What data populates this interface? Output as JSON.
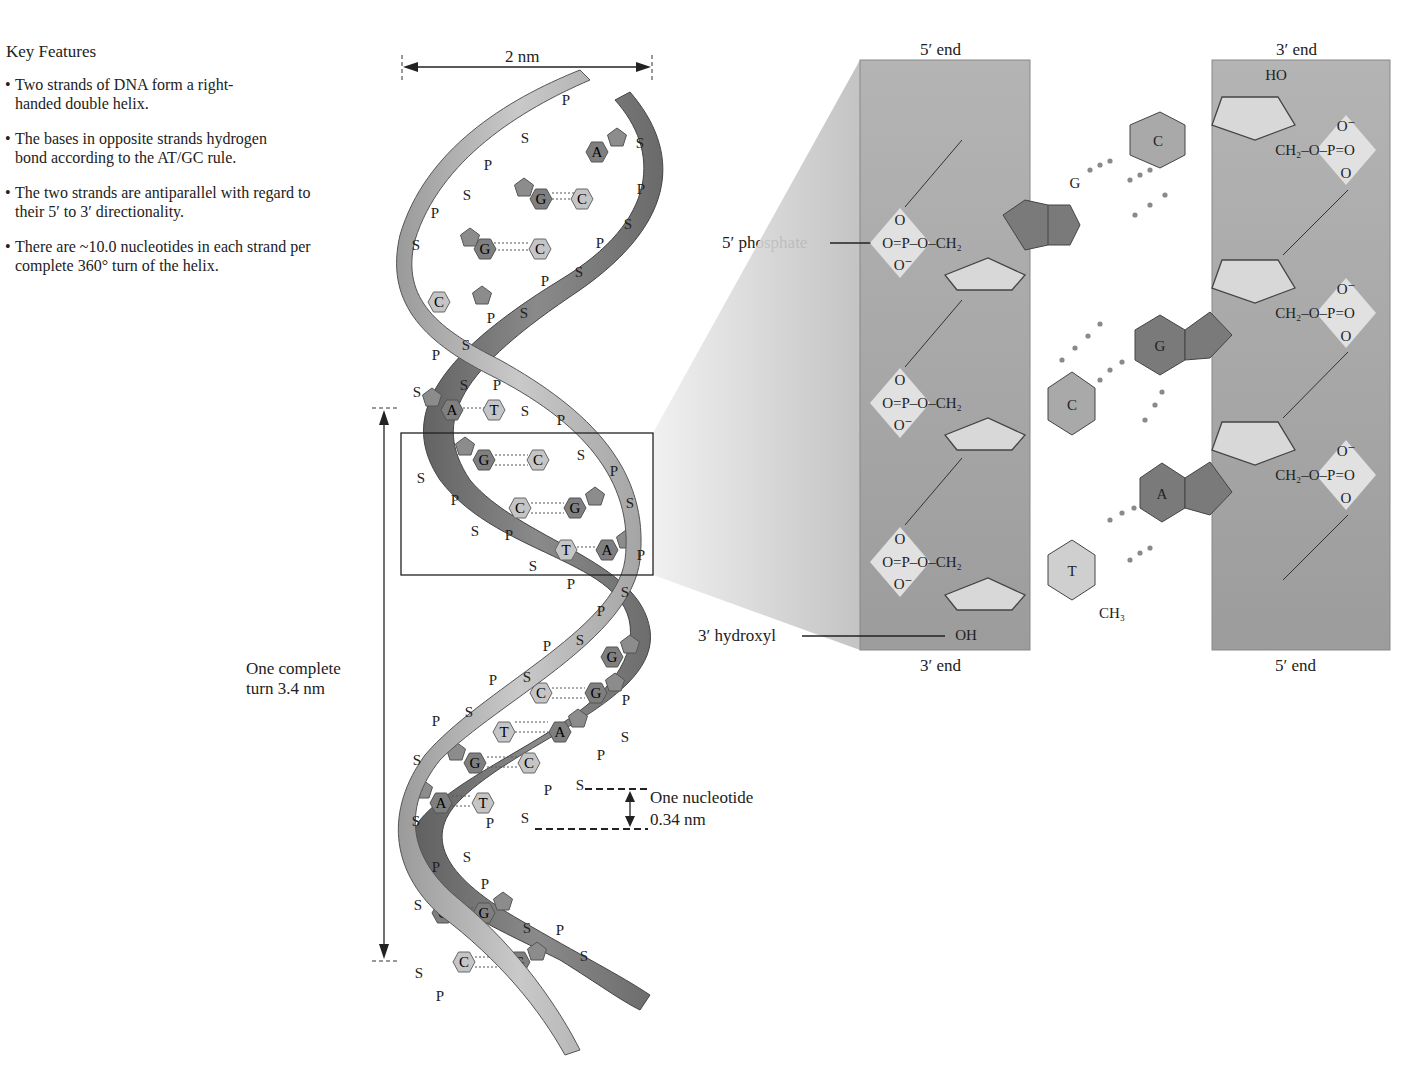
{
  "key_features": {
    "title": "Key Features",
    "items": [
      "Two strands of DNA form a right-handed double helix.",
      "The bases in opposite strands hydrogen bond according to the AT/GC rule.",
      "The two strands are antiparallel with regard to their 5′ to 3′ directionality.",
      "There are ~10.0 nucleotides in each strand per complete 360° turn of the helix."
    ]
  },
  "helix": {
    "width_label": "2 nm",
    "turn_label_line1": "One complete",
    "turn_label_line2": "turn 3.4 nm",
    "nucleotide_label_line1": "One nucleotide",
    "nucleotide_label_line2": "0.34 nm",
    "base_pairs_top_to_bottom": [
      [
        "A",
        "T"
      ],
      [
        "G",
        "C"
      ],
      [
        "G",
        "C"
      ],
      [
        "C",
        "G"
      ],
      [
        "A",
        "T"
      ],
      [
        "G",
        "C"
      ],
      [
        "C",
        "G"
      ],
      [
        "T",
        "A"
      ],
      [
        "C",
        "G"
      ],
      [
        "C",
        "G"
      ],
      [
        "T",
        "A"
      ],
      [
        "G",
        "C"
      ],
      [
        "A",
        "T"
      ],
      [
        "C",
        "G"
      ],
      [
        "C",
        "G"
      ]
    ],
    "backbone_letters": {
      "sugar": "S",
      "phosphate": "P"
    }
  },
  "detail": {
    "left_strand": {
      "top_label": "5′ end",
      "bottom_label": "3′ end"
    },
    "right_strand": {
      "top_label": "3′ end",
      "bottom_label": "5′ end"
    },
    "callouts": {
      "phosphate": "5′ phosphate",
      "hydroxyl": "3′ hydroxyl"
    },
    "base_pairs": [
      {
        "left": "G",
        "right": "C",
        "hbonds": 3
      },
      {
        "left": "C",
        "right": "G",
        "hbonds": 3
      },
      {
        "left": "T",
        "right": "A",
        "hbonds": 2
      }
    ],
    "groups": {
      "phosphate_left": [
        "O",
        "O=P–O–CH₂",
        "O⁻"
      ],
      "phosphate_right": [
        "O⁻",
        "CH₂–O–P=O",
        "O"
      ],
      "top_right_ho": "HO",
      "bottom_left_oh": "OH",
      "methyl": "CH₃"
    }
  },
  "colors": {
    "strand_dark": "#6e6e6e",
    "strand_light": "#b5b5b5",
    "base_dark": "#808080",
    "base_light": "#c8c8c8",
    "panel": "#aaaaaa",
    "zoom_wedge": "#cfcfcf"
  }
}
